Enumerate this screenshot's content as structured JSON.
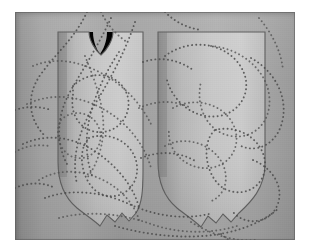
{
  "figure": {
    "kind": "photograph",
    "palette": {
      "paper": "#ffffff",
      "background_light": "#adadad",
      "background_dark": "#8d8d8d",
      "shield_fill_light": "#c9c9c9",
      "shield_fill_dark": "#8f8f8f",
      "shield_outline": "#5a5a5a",
      "dot_color": "#4a4a4a",
      "plate_border": "#6b6b6b"
    },
    "plate": {
      "left": 15,
      "top": 12,
      "width": 280,
      "height": 228
    },
    "shields": [
      {
        "name": "left-shield",
        "top_style": "notched-v",
        "bottom_style": "pointed-ogee",
        "bounds": {
          "x": 43,
          "y": 20,
          "width": 85,
          "height": 200
        }
      },
      {
        "name": "right-shield",
        "top_style": "flat",
        "bottom_style": "pointed-ogee",
        "bounds": {
          "x": 143,
          "y": 20,
          "width": 107,
          "height": 200
        }
      }
    ],
    "dotted_tracery": {
      "style": "beaded-dotted-curves",
      "dot_radius": 0.95,
      "dot_spacing": 4.1,
      "stroke_count": 22
    }
  }
}
